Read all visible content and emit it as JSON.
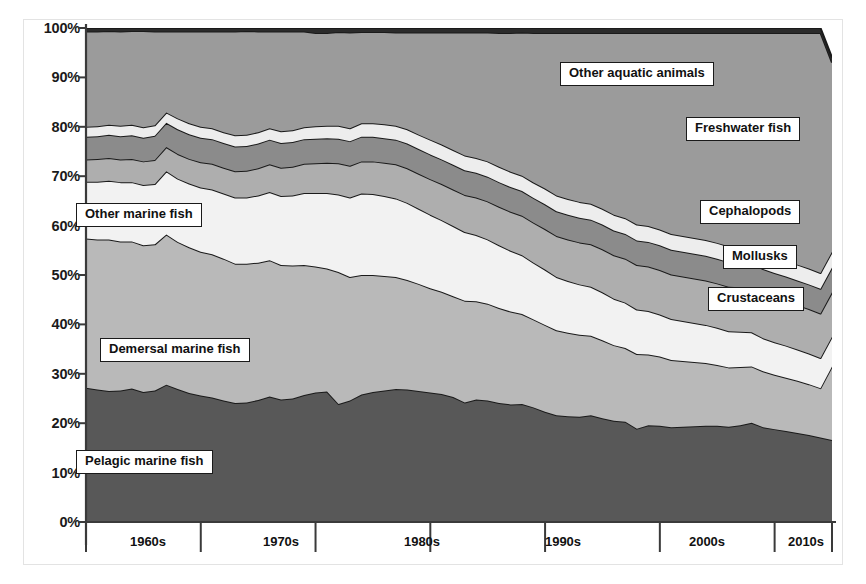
{
  "figure": {
    "background": "#ffffff",
    "border_color": "#e3e3e3"
  },
  "axes": {
    "y_ticks": [
      "0%",
      "10%",
      "20%",
      "30%",
      "40%",
      "50%",
      "60%",
      "70%",
      "80%",
      "90%",
      "100%"
    ],
    "x_ticks": [
      "1960s",
      "1970s",
      "1980s",
      "1990s",
      "2000s",
      "2010s"
    ]
  },
  "labels": {
    "other_aquatic_animals": "Other aquatic animals",
    "freshwater_fish": "Freshwater fish",
    "cephalopods": "Cephalopods",
    "mollusks": "Mollusks",
    "crustaceans": "Crustaceans",
    "other_marine_fish": "Other marine fish",
    "demersal_marine_fish": "Demersal marine fish",
    "pelagic_marine_fish": "Pelagic marine fish"
  },
  "chart_data": {
    "type": "area",
    "stacked": true,
    "normalized": true,
    "title": "",
    "xlabel": "",
    "ylabel": "",
    "ylim": [
      0,
      100
    ],
    "xlim": [
      1950,
      2015
    ],
    "grid": false,
    "legend": "inline-callout-boxes",
    "series_colors": {
      "Pelagic marine fish": "#585858",
      "Demersal marine fish": "#b9b9b9",
      "Other marine fish": "#f2f2f2",
      "Crustaceans": "#aeaeae",
      "Mollusks": "#8b8b8b",
      "Cephalopods": "#ededed",
      "Freshwater fish": "#9b9b9b",
      "Other aquatic animals": "#2b2b2b"
    },
    "x": [
      1950,
      1951,
      1952,
      1953,
      1954,
      1955,
      1956,
      1957,
      1958,
      1959,
      1960,
      1961,
      1962,
      1963,
      1964,
      1965,
      1966,
      1967,
      1968,
      1969,
      1970,
      1971,
      1972,
      1973,
      1974,
      1975,
      1976,
      1977,
      1978,
      1979,
      1980,
      1981,
      1982,
      1983,
      1984,
      1985,
      1986,
      1987,
      1988,
      1989,
      1990,
      1991,
      1992,
      1993,
      1994,
      1995,
      1996,
      1997,
      1998,
      1999,
      2000,
      2001,
      2002,
      2003,
      2004,
      2005,
      2006,
      2007,
      2008,
      2009,
      2010,
      2011,
      2012,
      2013,
      2014,
      2015
    ],
    "series": [
      {
        "name": "Pelagic marine fish",
        "values": [
          27.2,
          26.8,
          26.5,
          26.6,
          27.0,
          26.3,
          26.6,
          27.8,
          26.9,
          26.1,
          25.6,
          25.2,
          24.6,
          24.1,
          24.2,
          24.7,
          25.4,
          24.8,
          25.0,
          25.7,
          26.2,
          26.4,
          23.9,
          24.6,
          25.8,
          26.3,
          26.6,
          26.9,
          26.8,
          26.5,
          26.2,
          25.9,
          25.3,
          24.2,
          24.8,
          24.6,
          24.1,
          23.8,
          23.9,
          23.2,
          22.3,
          21.6,
          21.4,
          21.3,
          21.6,
          21.0,
          20.5,
          20.3,
          18.9,
          19.6,
          19.5,
          19.2,
          19.3,
          19.4,
          19.5,
          19.5,
          19.3,
          19.6,
          20.1,
          19.2,
          18.8,
          18.4,
          18.0,
          17.6,
          17.1,
          16.6
        ]
      },
      {
        "name": "Demersal marine fish",
        "values": [
          30.2,
          30.4,
          30.7,
          30.2,
          29.8,
          29.7,
          29.6,
          30.4,
          29.8,
          29.5,
          29.1,
          29.0,
          28.7,
          28.2,
          28.1,
          27.8,
          27.6,
          27.2,
          26.9,
          26.3,
          25.5,
          24.9,
          26.7,
          25.0,
          24.2,
          23.7,
          23.2,
          22.7,
          22.2,
          21.7,
          21.1,
          20.7,
          20.4,
          20.6,
          19.9,
          19.6,
          19.2,
          18.8,
          18.2,
          17.8,
          17.6,
          17.2,
          16.9,
          16.6,
          16.1,
          15.8,
          15.3,
          14.9,
          15.1,
          14.3,
          14.0,
          13.6,
          13.3,
          13.0,
          12.7,
          12.3,
          12.0,
          11.8,
          11.4,
          11.3,
          11.0,
          10.8,
          10.6,
          10.3,
          10.0,
          14.9
        ]
      },
      {
        "name": "Other marine fish",
        "values": [
          11.5,
          11.7,
          11.9,
          12.0,
          12.0,
          12.2,
          12.2,
          12.8,
          12.8,
          12.9,
          13.0,
          13.1,
          13.2,
          13.4,
          13.4,
          13.6,
          13.8,
          14.0,
          14.2,
          14.6,
          14.9,
          15.3,
          15.7,
          16.1,
          16.5,
          16.4,
          16.2,
          15.9,
          15.6,
          15.2,
          14.9,
          14.5,
          14.2,
          13.9,
          13.4,
          13.0,
          12.7,
          12.3,
          11.9,
          11.5,
          11.2,
          10.8,
          10.5,
          10.2,
          9.9,
          9.7,
          9.4,
          9.2,
          9.0,
          8.8,
          8.5,
          8.3,
          8.1,
          7.9,
          7.7,
          7.5,
          7.3,
          7.1,
          6.9,
          6.7,
          6.6,
          6.5,
          6.3,
          6.2,
          6.1,
          6.0
        ]
      },
      {
        "name": "Crustaceans",
        "values": [
          4.5,
          4.6,
          4.6,
          4.6,
          4.7,
          4.8,
          4.9,
          4.9,
          5.0,
          5.0,
          5.1,
          5.2,
          5.2,
          5.3,
          5.4,
          5.5,
          5.6,
          5.7,
          5.8,
          5.9,
          6.0,
          6.1,
          6.3,
          6.4,
          6.5,
          6.6,
          6.7,
          6.9,
          7.0,
          7.1,
          7.2,
          7.3,
          7.4,
          7.5,
          7.6,
          7.7,
          7.8,
          7.9,
          8.0,
          8.1,
          8.2,
          8.3,
          8.4,
          8.5,
          8.6,
          8.7,
          8.8,
          8.9,
          9.0,
          9.0,
          9.0,
          9.0,
          9.0,
          9.0,
          9.0,
          9.0,
          9.0,
          9.0,
          9.0,
          9.0,
          9.0,
          9.0,
          9.0,
          9.0,
          9.0,
          9.0
        ]
      },
      {
        "name": "Mollusks",
        "values": [
          4.6,
          4.6,
          4.7,
          4.7,
          4.8,
          4.8,
          4.9,
          4.9,
          5.0,
          5.0,
          5.0,
          5.0,
          5.0,
          5.0,
          5.0,
          5.0,
          5.0,
          5.0,
          5.0,
          5.0,
          5.0,
          5.0,
          5.0,
          5.0,
          5.0,
          5.0,
          5.0,
          5.0,
          5.0,
          5.0,
          5.0,
          5.0,
          5.0,
          5.0,
          5.0,
          5.0,
          5.0,
          5.0,
          5.0,
          5.0,
          5.0,
          5.0,
          5.0,
          5.0,
          5.0,
          5.0,
          5.0,
          5.0,
          5.0,
          5.0,
          5.0,
          5.0,
          5.0,
          5.0,
          5.0,
          5.0,
          5.0,
          5.0,
          5.0,
          5.0,
          5.0,
          5.0,
          5.0,
          5.0,
          5.0,
          5.0
        ]
      },
      {
        "name": "Cephalopods",
        "values": [
          2.0,
          2.0,
          2.0,
          2.1,
          2.1,
          2.1,
          2.1,
          2.1,
          2.2,
          2.2,
          2.2,
          2.2,
          2.2,
          2.3,
          2.3,
          2.3,
          2.3,
          2.4,
          2.4,
          2.4,
          2.5,
          2.5,
          2.6,
          2.6,
          2.7,
          2.7,
          2.8,
          2.8,
          2.9,
          2.9,
          3.0,
          3.0,
          3.0,
          3.0,
          3.0,
          3.1,
          3.1,
          3.1,
          3.1,
          3.1,
          3.2,
          3.2,
          3.2,
          3.2,
          3.2,
          3.2,
          3.2,
          3.2,
          3.2,
          3.2,
          3.2,
          3.2,
          3.2,
          3.2,
          3.2,
          3.2,
          3.2,
          3.2,
          3.2,
          3.2,
          3.2,
          3.2,
          3.2,
          3.2,
          3.2,
          3.2
        ]
      },
      {
        "name": "Freshwater fish",
        "values": [
          19.3,
          19.2,
          19.0,
          19.1,
          19.0,
          19.5,
          19.0,
          16.4,
          17.6,
          18.6,
          19.3,
          19.6,
          20.4,
          21.0,
          21.0,
          20.4,
          19.6,
          20.2,
          20.0,
          19.4,
          18.9,
          18.8,
          19.0,
          19.4,
          18.5,
          18.5,
          18.7,
          18.9,
          19.6,
          20.7,
          21.7,
          22.7,
          23.8,
          24.9,
          25.4,
          26.1,
          27.1,
          28.1,
          29.0,
          30.3,
          31.5,
          32.9,
          33.6,
          34.2,
          34.6,
          35.6,
          36.8,
          37.5,
          38.8,
          39.1,
          39.8,
          40.7,
          41.1,
          41.5,
          41.9,
          42.5,
          43.2,
          43.3,
          43.4,
          44.6,
          45.4,
          46.1,
          46.9,
          47.7,
          48.6,
          38.3
        ]
      },
      {
        "name": "Other aquatic animals",
        "values": [
          0.7,
          0.7,
          0.6,
          0.7,
          0.6,
          0.6,
          0.7,
          0.7,
          0.7,
          0.7,
          0.7,
          0.7,
          0.7,
          0.7,
          0.6,
          0.7,
          0.7,
          0.7,
          0.7,
          0.7,
          1.0,
          1.0,
          0.8,
          0.9,
          0.8,
          0.8,
          0.8,
          0.9,
          0.9,
          0.9,
          0.9,
          0.9,
          0.9,
          0.9,
          0.9,
          0.9,
          1.0,
          1.0,
          1.0,
          1.0,
          1.0,
          1.0,
          1.0,
          1.0,
          1.0,
          1.0,
          1.1,
          1.0,
          1.0,
          1.0,
          1.0,
          1.0,
          1.0,
          1.0,
          1.0,
          1.0,
          1.0,
          1.0,
          1.0,
          1.0,
          1.0,
          1.0,
          1.0,
          1.0,
          1.0,
          1.0
        ]
      }
    ],
    "approx_boundaries_pct": {
      "note": "cumulative top-of-band percentages at decade markers",
      "at_1960": {
        "pelagic": 27.2,
        "demersal": 57.4,
        "other_marine": 68.9,
        "crustaceans": 73.4,
        "mollusks": 78.0,
        "cephalopods": 80.0,
        "freshwater": 99.3
      },
      "at_1970": {
        "pelagic": 26.2,
        "demersal": 51.7,
        "other_marine": 66.6,
        "crustaceans": 72.6,
        "mollusks": 77.6,
        "cephalopods": 80.1,
        "freshwater": 99.0
      },
      "at_1980": {
        "pelagic": 26.2,
        "demersal": 47.3,
        "other_marine": 62.2,
        "crustaceans": 69.4,
        "mollusks": 74.4,
        "cephalopods": 77.4,
        "freshwater": 99.1
      },
      "at_1990": {
        "pelagic": 22.3,
        "demersal": 39.9,
        "other_marine": 51.1,
        "crustaceans": 59.3,
        "mollusks": 64.3,
        "cephalopods": 67.5,
        "freshwater": 99.0
      },
      "at_2000": {
        "pelagic": 19.5,
        "demersal": 33.5,
        "other_marine": 42.0,
        "crustaceans": 51.0,
        "mollusks": 56.0,
        "cephalopods": 59.2,
        "freshwater": 99.0
      },
      "at_2010": {
        "pelagic": 18.8,
        "demersal": 29.8,
        "other_marine": 36.4,
        "crustaceans": 45.4,
        "mollusks": 50.4,
        "cephalopods": 53.6,
        "freshwater": 99.0
      },
      "at_2015": {
        "pelagic": 16.6,
        "demersal": 31.5,
        "other_marine": 37.5,
        "crustaceans": 46.5,
        "mollusks": 51.5,
        "cephalopods": 54.7,
        "freshwater": 93.0
      }
    }
  }
}
